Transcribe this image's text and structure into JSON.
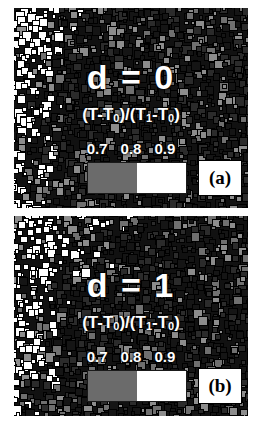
{
  "figure": {
    "background_color": "#ffffff",
    "panel_count": 2
  },
  "panels": [
    {
      "id": "a",
      "panel_label": "(a)",
      "d_label": "d = 0",
      "formula_prefix": "(T-T",
      "formula_sub1": "0",
      "formula_mid": ")/(T",
      "formula_sub2": "1",
      "formula_mid2": "-T",
      "formula_sub3": "0",
      "formula_suffix": ")",
      "formula_plain": "(T-T0)/(T1-T0)",
      "ticks": [
        "0.7",
        "0.8",
        "0.9"
      ],
      "colorbar": {
        "segments": [
          {
            "label": "0.7-0.8",
            "color": "#6b6b6b",
            "width_pct": 50
          },
          {
            "label": "0.8-0.9",
            "color": "#ffffff",
            "width_pct": 50
          }
        ]
      }
    },
    {
      "id": "b",
      "panel_label": "(b)",
      "d_label": "d = 1",
      "formula_prefix": "(T-T",
      "formula_sub1": "0",
      "formula_mid": ")/(T",
      "formula_sub2": "1",
      "formula_mid2": "-T",
      "formula_sub3": "0",
      "formula_suffix": ")",
      "formula_plain": "(T-T0)/(T1-T0)",
      "ticks": [
        "0.7",
        "0.8",
        "0.9"
      ],
      "colorbar": {
        "segments": [
          {
            "label": "0.7-0.8",
            "color": "#6b6b6b",
            "width_pct": 50
          },
          {
            "label": "0.8-0.9",
            "color": "#ffffff",
            "width_pct": 50
          }
        ]
      }
    }
  ],
  "chart_data": {
    "type": "heatmap",
    "title": "",
    "xlabel": "",
    "ylabel": "",
    "colorbar_label": "(T-T0)/(T1-T0)",
    "colorbar_ticks": [
      0.7,
      0.8,
      0.9
    ],
    "colorbar_colors": [
      "#6b6b6b",
      "#ffffff"
    ],
    "grid": false,
    "legend_position": "none",
    "panels": [
      {
        "panel": "(a)",
        "parameter": "d",
        "value": 0,
        "field_description": "white (high value) squares concentrated in a band along the left edge and upper-left corner; interior mostly dark/gray",
        "white_fraction_estimate": 0.18,
        "gray_fraction_estimate": 0.34,
        "dark_fraction_estimate": 0.48
      },
      {
        "panel": "(b)",
        "parameter": "d",
        "value": 1,
        "field_description": "white (high value) squares form a broader curved front sweeping from upper-left across the top; interior dark/gray",
        "white_fraction_estimate": 0.24,
        "gray_fraction_estimate": 0.3,
        "dark_fraction_estimate": 0.46
      }
    ]
  }
}
